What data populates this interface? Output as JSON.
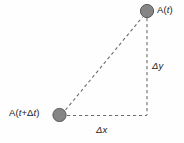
{
  "figure": {
    "background_color": "#fefefe",
    "line_color": "#6e6e6e",
    "marker_fill": "#858585",
    "marker_stroke": "#5a5a5a",
    "text_color": "#1c1c1c"
  },
  "labels": {
    "point_final": "A(t)",
    "point_initial": "A(t+Δt)",
    "delta_y": "Δy",
    "delta_x": "Δx"
  },
  "chart_data": {
    "type": "scatter",
    "title": "",
    "xlabel": "",
    "ylabel": "",
    "grid": false,
    "legend": null,
    "points": [
      {
        "name": "A(t)",
        "x": 147,
        "y": 11,
        "label": "A(t)"
      },
      {
        "name": "A(t+Δt)",
        "x": 60,
        "y": 115,
        "label": "A(t+Δt)"
      }
    ],
    "segments": [
      {
        "name": "hypotenuse",
        "from": "A(t+Δt)",
        "to": "A(t)",
        "style": "dashed"
      },
      {
        "name": "delta-y-leg",
        "from": "A(t)",
        "to": "corner",
        "style": "dashed",
        "annotation": "Δy"
      },
      {
        "name": "delta-x-leg",
        "from": "A(t+Δt)",
        "to": "corner",
        "style": "dashed",
        "annotation": "Δx"
      }
    ],
    "corner": {
      "x": 147,
      "y": 115
    }
  }
}
